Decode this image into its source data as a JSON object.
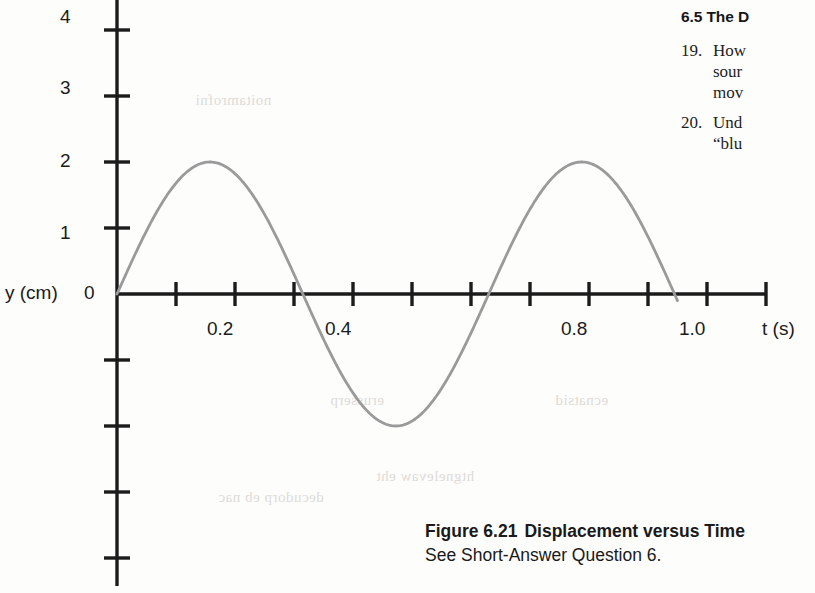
{
  "chart_data": {
    "type": "line",
    "title": "",
    "xlabel": "t (s)",
    "ylabel": "y (cm)",
    "xlim": [
      0,
      1.1
    ],
    "ylim": [
      -4.4,
      4.4
    ],
    "grid": false,
    "legend": null,
    "x_tick_labels": [
      "0.2",
      "0.4",
      "0.8",
      "1.0"
    ],
    "x_tick_values": [
      0.2,
      0.4,
      0.8,
      1.0
    ],
    "x_all_ticks": [
      0.1,
      0.2,
      0.3,
      0.4,
      0.5,
      0.6,
      0.7,
      0.8,
      0.9,
      1.0,
      1.1
    ],
    "y_tick_labels": [
      "4",
      "3",
      "2",
      "1",
      "0"
    ],
    "y_tick_values": [
      4,
      3,
      2,
      1,
      0
    ],
    "y_all_ticks": [
      4,
      3,
      2,
      1,
      0,
      -1,
      -2,
      -3,
      -4
    ],
    "series": [
      {
        "name": "displacement",
        "description": "sine wave, amplitude 2 cm, period 0.63 s",
        "amplitude": 2.0,
        "period": 0.63,
        "phase": 0,
        "t_start": 0.0,
        "t_end": 0.95,
        "points": [
          {
            "t": 0.0,
            "y": 0.0
          },
          {
            "t": 0.08,
            "y": 1.43
          },
          {
            "t": 0.16,
            "y": 2.0
          },
          {
            "t": 0.24,
            "y": 1.43
          },
          {
            "t": 0.315,
            "y": 0.0
          },
          {
            "t": 0.39,
            "y": -1.43
          },
          {
            "t": 0.47,
            "y": -2.0
          },
          {
            "t": 0.55,
            "y": -1.43
          },
          {
            "t": 0.63,
            "y": 0.0
          },
          {
            "t": 0.71,
            "y": 1.43
          },
          {
            "t": 0.79,
            "y": 2.0
          },
          {
            "t": 0.87,
            "y": 1.43
          },
          {
            "t": 0.945,
            "y": 0.0
          },
          {
            "t": 0.95,
            "y": -0.6
          }
        ]
      }
    ],
    "curve_color": "#9a9a9a",
    "axis_color": "#1b1b1b"
  },
  "axis": {
    "y_label": "y (cm)",
    "zero_label": "0",
    "x_label": "t (s)",
    "y_ticks": [
      {
        "label": "4"
      },
      {
        "label": "3"
      },
      {
        "label": "2"
      },
      {
        "label": "1"
      }
    ],
    "x_ticks": [
      {
        "label": "0.2"
      },
      {
        "label": "0.4"
      },
      {
        "label": "0.8"
      },
      {
        "label": "1.0"
      }
    ]
  },
  "text_column": {
    "section_heading": "6.5 The D",
    "questions": [
      {
        "number": "19.",
        "lines": [
          "How",
          "sour",
          "mov"
        ]
      },
      {
        "number": "20.",
        "lines": [
          "Und",
          "“blu"
        ]
      }
    ]
  },
  "caption": {
    "figure_label": "Figure 6.21",
    "figure_title": "Displacement versus Time",
    "subtitle": "See Short-Answer Question 6."
  },
  "artifacts": {
    "bleed_texts": [
      "noitamrofni",
      "erusserp",
      "decudorp eb nac",
      "htgnelevaw eht",
      "ecnatsid"
    ]
  },
  "colors": {
    "page_background": "#fdfdfc",
    "ink": "#1b1b1b",
    "curve": "#9a9a9a",
    "bleed": "#dedbd6"
  }
}
